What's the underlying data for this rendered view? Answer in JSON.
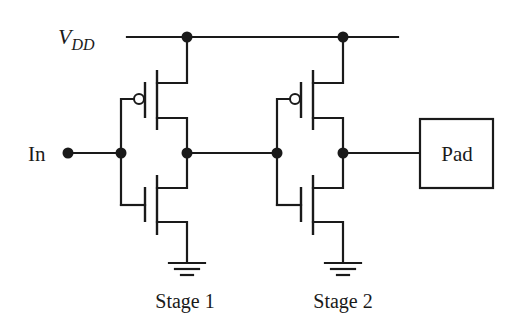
{
  "diagram": {
    "type": "circuit-schematic",
    "labels": {
      "supply_main": "V",
      "supply_sub": "DD",
      "input": "In",
      "stage1": "Stage 1",
      "stage2": "Stage 2",
      "pad": "Pad"
    },
    "stages": [
      {
        "name": "Stage 1",
        "pmos": "PMOS pull-up",
        "nmos": "NMOS pull-down"
      },
      {
        "name": "Stage 2",
        "pmos": "PMOS pull-up",
        "nmos": "NMOS pull-down"
      }
    ],
    "colors": {
      "ink": "#1a1a1a",
      "background": "#ffffff"
    }
  }
}
